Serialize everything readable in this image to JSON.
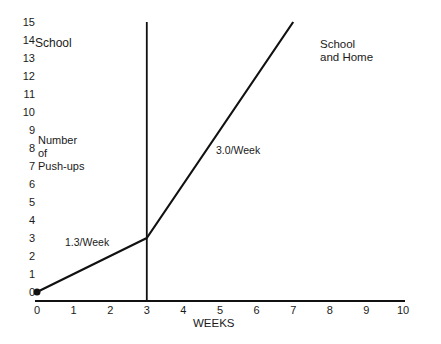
{
  "chart_data": {
    "type": "line",
    "title": "",
    "xlabel": "WEEKS",
    "ylabel": "Number of Push-ups",
    "xlim": [
      0,
      10
    ],
    "ylim": [
      0,
      15
    ],
    "x_ticks": [
      0,
      1,
      2,
      3,
      4,
      5,
      6,
      7,
      8,
      9,
      10
    ],
    "y_ticks": [
      0,
      1,
      2,
      3,
      4,
      5,
      6,
      7,
      8,
      9,
      10,
      11,
      12,
      13,
      14,
      15
    ],
    "grid": false,
    "series": [
      {
        "name": "Push-ups",
        "x": [
          0,
          3,
          7
        ],
        "y": [
          0,
          3,
          15
        ]
      }
    ],
    "phase_divider_x": 3,
    "annotations": [
      {
        "text": "School",
        "region": "phase 1 (weeks 0-3)"
      },
      {
        "text": "School and Home",
        "region": "phase 2 (weeks 3-10)"
      },
      {
        "text": "1.3/Week",
        "near": "segment weeks 0-3"
      },
      {
        "text": "3.0/Week",
        "near": "segment weeks 3-7"
      }
    ]
  },
  "labels": {
    "ylabel_line1": "Number",
    "ylabel_line2": "of",
    "ylabel_line3": "Push-ups",
    "xlabel": "WEEKS",
    "phase1": "School",
    "phase2_line1": "School",
    "phase2_line2": "and Home",
    "rate1": "1.3/Week",
    "rate2": "3.0/Week"
  }
}
